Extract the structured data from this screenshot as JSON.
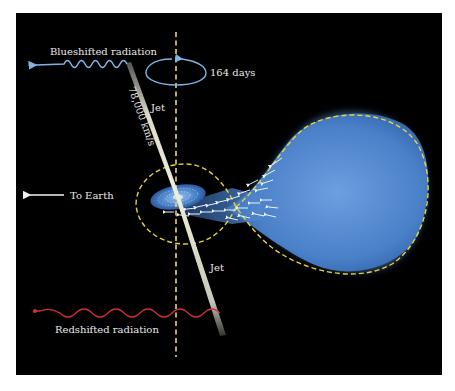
{
  "labels": {
    "blueshifted": "Blueshifted radiation",
    "period": "164 days",
    "velocity": "78,000 km/s",
    "jet_upper": "Jet",
    "jet_lower": "Jet",
    "to_earth": "To Earth",
    "redshifted": "Redshifted radiation"
  },
  "colors": {
    "background": "#000000",
    "page": "#ffffff",
    "blue_wave": "#7fb4e6",
    "red_wave": "#d6303a",
    "axis_dash": "#e8d470",
    "roche_lobe": "#e6d23a",
    "star_fill": "#4f86cc",
    "jet": "#e6e6d8",
    "arrow_white": "#f0f0f0"
  }
}
